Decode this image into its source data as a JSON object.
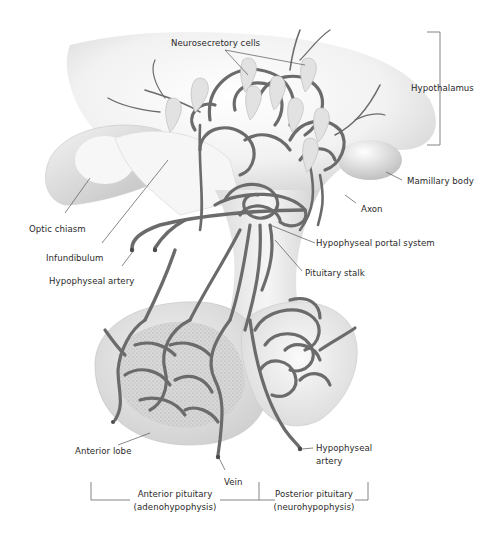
{
  "diagram": {
    "type": "anatomical-illustration",
    "colors": {
      "background": "#ffffff",
      "vessel": "#6b6b6b",
      "vessel_dark": "#4a4a4a",
      "tissue_light": "#e6e6e6",
      "tissue_mid": "#cfcfcf",
      "stipple": "#bdbdbd",
      "label_text": "#2a2a2a",
      "leader_line": "#555555"
    },
    "labels": {
      "neurosecretory_cells": "Neurosecretory cells",
      "hypothalamus": "Hypothalamus",
      "mamillary_body": "Mamillary body",
      "axon": "Axon",
      "optic_chiasm": "Optic chiasm",
      "infundibulum": "Infundibulum",
      "hypophyseal_portal_system": "Hypophyseal portal system",
      "hypophyseal_artery_upper": "Hypophyseal artery",
      "pituitary_stalk": "Pituitary stalk",
      "anterior_lobe": "Anterior lobe",
      "hypophyseal_artery_lower_line1": "Hypophyseal",
      "hypophyseal_artery_lower_line2": "artery",
      "vein": "Vein",
      "anterior_pituitary_line1": "Anterior pituitary",
      "anterior_pituitary_line2": "(adenohypophysis)",
      "posterior_pituitary_line1": "Posterior pituitary",
      "posterior_pituitary_line2": "(neurohypophysis)"
    }
  }
}
